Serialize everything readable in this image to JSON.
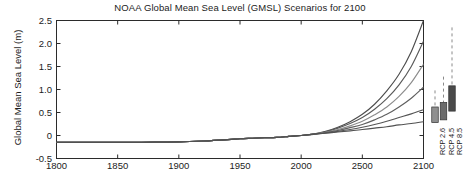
{
  "chart_data": {
    "type": "line",
    "title": "NOAA Global Mean Sea Level (GMSL) Scenarios for 2100",
    "xlabel": "",
    "ylabel": "Global Mean Sea Level (m)",
    "xlim": [
      1800,
      2100
    ],
    "ylim": [
      -0.5,
      2.5
    ],
    "grid": false,
    "legend": "none",
    "xticks": [
      1800,
      1850,
      1900,
      1950,
      2000,
      2500,
      2100
    ],
    "xtick_labels": [
      "1800",
      "1850",
      "1900",
      "1950",
      "2000",
      "2500",
      "2100"
    ],
    "xtick_values": [
      1800,
      1850,
      1900,
      1950,
      2000,
      2050,
      2100
    ],
    "yticks": [
      -0.5,
      0,
      0.5,
      1.0,
      1.5,
      2.0,
      2.5
    ],
    "ytick_labels": [
      "-0.5",
      "0",
      "0.5",
      "1.0",
      "1.5",
      "2.0",
      "2.5"
    ],
    "x": [
      1800,
      1820,
      1840,
      1860,
      1880,
      1900,
      1920,
      1940,
      1950,
      1960,
      1970,
      1980,
      1990,
      2000,
      2010,
      2020,
      2030,
      2040,
      2050,
      2060,
      2070,
      2080,
      2090,
      2100
    ],
    "series": [
      {
        "name": "Extreme",
        "color": "#4d4d4d",
        "values": [
          -0.15,
          -0.15,
          -0.15,
          -0.15,
          -0.145,
          -0.14,
          -0.12,
          -0.09,
          -0.07,
          -0.06,
          -0.05,
          -0.04,
          -0.02,
          0.0,
          0.03,
          0.09,
          0.18,
          0.3,
          0.46,
          0.68,
          0.97,
          1.33,
          1.82,
          2.5
        ]
      },
      {
        "name": "High",
        "color": "#5a5a5a",
        "values": [
          -0.15,
          -0.15,
          -0.15,
          -0.15,
          -0.145,
          -0.14,
          -0.12,
          -0.09,
          -0.07,
          -0.06,
          -0.05,
          -0.04,
          -0.02,
          0.0,
          0.03,
          0.08,
          0.16,
          0.26,
          0.39,
          0.57,
          0.8,
          1.1,
          1.5,
          2.05
        ]
      },
      {
        "name": "Intermediate-High",
        "color": "#8c8c8c",
        "values": [
          -0.15,
          -0.15,
          -0.15,
          -0.15,
          -0.145,
          -0.14,
          -0.12,
          -0.09,
          -0.07,
          -0.06,
          -0.05,
          -0.04,
          -0.02,
          0.0,
          0.03,
          0.07,
          0.13,
          0.21,
          0.31,
          0.45,
          0.62,
          0.85,
          1.15,
          1.55
        ]
      },
      {
        "name": "Intermediate",
        "color": "#5f5f5f",
        "values": [
          -0.15,
          -0.15,
          -0.15,
          -0.15,
          -0.145,
          -0.14,
          -0.12,
          -0.09,
          -0.07,
          -0.06,
          -0.05,
          -0.04,
          -0.02,
          0.0,
          0.03,
          0.06,
          0.11,
          0.17,
          0.24,
          0.34,
          0.46,
          0.62,
          0.81,
          1.05
        ]
      },
      {
        "name": "Intermediate-Low",
        "color": "#555555",
        "values": [
          -0.15,
          -0.15,
          -0.15,
          -0.15,
          -0.145,
          -0.14,
          -0.12,
          -0.09,
          -0.07,
          -0.06,
          -0.05,
          -0.04,
          -0.02,
          0.0,
          0.03,
          0.055,
          0.09,
          0.13,
          0.18,
          0.24,
          0.31,
          0.39,
          0.47,
          0.56
        ]
      },
      {
        "name": "Low",
        "color": "#515151",
        "values": [
          -0.15,
          -0.15,
          -0.15,
          -0.15,
          -0.145,
          -0.14,
          -0.12,
          -0.09,
          -0.07,
          -0.06,
          -0.05,
          -0.04,
          -0.02,
          0.0,
          0.025,
          0.05,
          0.075,
          0.1,
          0.13,
          0.16,
          0.19,
          0.23,
          0.26,
          0.3
        ]
      }
    ],
    "rcp_markers": [
      {
        "label": "RCP 2.6",
        "box_low": 0.28,
        "box_high": 0.62,
        "whisker_high": 0.98,
        "color": "#8f8f8f"
      },
      {
        "label": "RCP 4.5",
        "box_low": 0.34,
        "box_high": 0.72,
        "whisker_high": 1.28,
        "color": "#6b6b6b"
      },
      {
        "label": "RCP 8.5",
        "box_low": 0.53,
        "box_high": 1.08,
        "whisker_high": 2.35,
        "color": "#4a4a4a"
      }
    ]
  },
  "colors": {
    "axis": "#2b2b2b",
    "background": "#ffffff",
    "text": "#1c1c1c"
  }
}
